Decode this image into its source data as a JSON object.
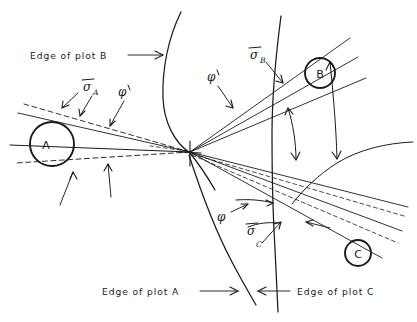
{
  "figure": {
    "type": "hand-drawn-geometric-diagram",
    "background_color": "#ffffff",
    "ink_color": "#1b1b1b",
    "width": 417,
    "height": 322
  },
  "captions": {
    "edge_of_plot_b": "Edge of plot B",
    "edge_of_plot_a": "Edge of plot A",
    "edge_of_plot_c": "Edge of plot C"
  },
  "circles": [
    {
      "id": "A",
      "label": "A",
      "cx": 52,
      "cy": 144,
      "r": 22
    },
    {
      "id": "B",
      "label": "B",
      "cx": 320,
      "cy": 73,
      "r": 15
    },
    {
      "id": "C",
      "label": "C",
      "cx": 358,
      "cy": 253,
      "r": 13
    }
  ],
  "angle_labels": [
    {
      "id": "sigma-a",
      "symbol": "σ",
      "subscript": "A",
      "overbar": true,
      "x": 88,
      "y": 87
    },
    {
      "id": "phi-prime-a",
      "symbol": "φ",
      "subscript": "",
      "prime": true,
      "overbar": false,
      "x": 123,
      "y": 92
    },
    {
      "id": "phi-prime-b",
      "symbol": "φ",
      "subscript": "",
      "prime": true,
      "overbar": false,
      "x": 213,
      "y": 76
    },
    {
      "id": "sigma-b",
      "symbol": "σ",
      "subscript": "B",
      "overbar": true,
      "x": 255,
      "y": 55
    },
    {
      "id": "phi-c",
      "symbol": "φ",
      "subscript": "",
      "prime": false,
      "overbar": false,
      "x": 223,
      "y": 216
    },
    {
      "id": "sigma-c",
      "symbol": "σ",
      "subscript": "C",
      "overbar": true,
      "x": 252,
      "y": 231
    }
  ],
  "vertex": {
    "id": "convergence-point",
    "x": 190,
    "y": 152
  },
  "arc_names": [
    "edge-of-plot-b-arc",
    "edge-of-plot-a-arc",
    "edge-of-plot-c-arc",
    "secondary-arc-right"
  ]
}
